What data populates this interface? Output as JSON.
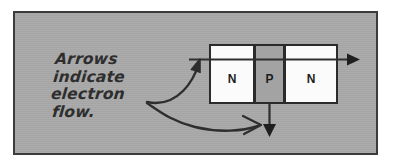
{
  "figure": {
    "kind": "npn-transistor-electron-flow-diagram",
    "frame_color": "#3c3c3c",
    "background_color": "#a9a9a9"
  },
  "caption": {
    "lines": [
      "Arrows",
      "indicate",
      "electron",
      "flow."
    ]
  },
  "device": {
    "segments": [
      {
        "label": "N",
        "type": "n-region",
        "fill": "#fbfbfb"
      },
      {
        "label": "P",
        "type": "p-region",
        "fill": "#a3a3a3"
      },
      {
        "label": "N",
        "type": "n-region",
        "fill": "#fbfbfb"
      }
    ],
    "outline_color": "#2b2b2b"
  },
  "arrows": {
    "color": "#2e2e2e",
    "horizontal_flow": "electron flow through emitter and collector",
    "vertical_flow": "electron flow out of base",
    "pointer_upper": "caption pointer to horizontal arrow",
    "pointer_lower": "caption pointer to vertical arrow"
  }
}
